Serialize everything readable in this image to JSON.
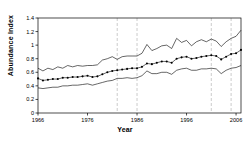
{
  "chart_data": {
    "type": "line",
    "title": "",
    "xlabel": "Year",
    "ylabel": "Abundance Index",
    "xlim": [
      1966,
      2007
    ],
    "ylim": [
      0,
      1.4
    ],
    "grid": false,
    "legend": "none",
    "xticks": [
      1966,
      1976,
      1986,
      1996,
      2006
    ],
    "xtick_labels": [
      "1966",
      "1976",
      "1986",
      "1996",
      "2006"
    ],
    "yticks": [
      0,
      0.2,
      0.4,
      0.6,
      0.8,
      1,
      1.2,
      1.4
    ],
    "ytick_labels": [
      "0",
      "0.2",
      "0.4",
      "0.6",
      "0.8",
      "1",
      "1.2",
      "1.4"
    ],
    "vertical_reference_lines": [
      1982,
      1986,
      2001,
      2005
    ],
    "x": [
      1966,
      1967,
      1968,
      1969,
      1970,
      1971,
      1972,
      1973,
      1974,
      1975,
      1976,
      1977,
      1978,
      1979,
      1980,
      1981,
      1982,
      1983,
      1984,
      1985,
      1986,
      1987,
      1988,
      1989,
      1990,
      1991,
      1992,
      1993,
      1994,
      1995,
      1996,
      1997,
      1998,
      1999,
      2000,
      2001,
      2002,
      2003,
      2004,
      2005,
      2006,
      2007
    ],
    "series": [
      {
        "name": "Abundance Index",
        "style": "markers-line",
        "values": [
          0.51,
          0.48,
          0.49,
          0.5,
          0.5,
          0.52,
          0.52,
          0.53,
          0.53,
          0.54,
          0.55,
          0.53,
          0.54,
          0.57,
          0.6,
          0.62,
          0.63,
          0.64,
          0.65,
          0.66,
          0.66,
          0.68,
          0.73,
          0.72,
          0.74,
          0.76,
          0.76,
          0.74,
          0.8,
          0.82,
          0.83,
          0.8,
          0.81,
          0.83,
          0.84,
          0.85,
          0.84,
          0.79,
          0.83,
          0.87,
          0.88,
          0.93
        ]
      },
      {
        "name": "Upper confidence limit",
        "style": "line",
        "values": [
          0.66,
          0.62,
          0.66,
          0.64,
          0.68,
          0.66,
          0.7,
          0.68,
          0.7,
          0.69,
          0.7,
          0.7,
          0.71,
          0.78,
          0.8,
          0.83,
          0.79,
          0.83,
          0.84,
          0.84,
          0.84,
          0.88,
          1.01,
          0.92,
          0.95,
          0.99,
          1.0,
          0.95,
          1.1,
          1.04,
          1.07,
          0.99,
          1.05,
          1.08,
          1.05,
          1.09,
          1.06,
          0.98,
          1.05,
          1.1,
          1.13,
          1.22
        ]
      },
      {
        "name": "Lower confidence limit",
        "style": "line",
        "values": [
          0.37,
          0.36,
          0.37,
          0.38,
          0.38,
          0.4,
          0.4,
          0.41,
          0.41,
          0.42,
          0.43,
          0.41,
          0.43,
          0.45,
          0.47,
          0.48,
          0.51,
          0.51,
          0.52,
          0.51,
          0.52,
          0.55,
          0.62,
          0.58,
          0.58,
          0.6,
          0.6,
          0.57,
          0.63,
          0.65,
          0.66,
          0.63,
          0.63,
          0.65,
          0.65,
          0.66,
          0.65,
          0.58,
          0.63,
          0.66,
          0.67,
          0.7
        ]
      }
    ]
  },
  "labels": {
    "xlabel": "Year",
    "ylabel": "Abundance Index"
  }
}
